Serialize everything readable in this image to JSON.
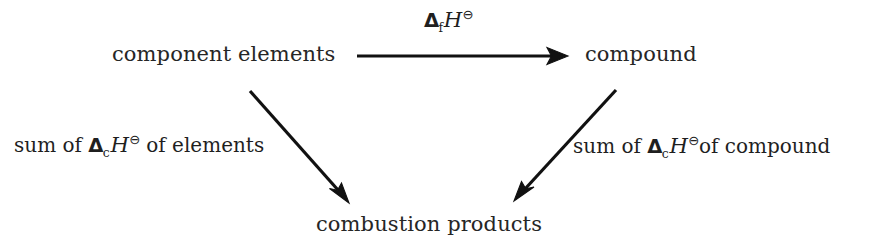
{
  "diagram": {
    "background_color": "#ffffff",
    "stroke_color": "#111111",
    "nodes": [
      {
        "id": "component-elements",
        "text": "component elements",
        "x": 112,
        "y": 42
      },
      {
        "id": "compound",
        "text": "compound",
        "x": 585,
        "y": 42
      },
      {
        "id": "combustion-products",
        "text": "combustion products",
        "x": 316,
        "y": 212
      }
    ],
    "edges": [
      {
        "id": "formation-arrow",
        "from": "component-elements",
        "to": "compound",
        "kind": "horizontal",
        "x1": 357,
        "y1": 56,
        "x2": 568,
        "y2": 56,
        "label_id": "formation-label"
      },
      {
        "id": "elements-combustion-arrow",
        "from": "component-elements",
        "to": "combustion-products",
        "kind": "diagonal-down-right",
        "x1": 250,
        "y1": 91,
        "x2": 349,
        "y2": 203,
        "label_id": "left-combustion-label"
      },
      {
        "id": "compound-combustion-arrow",
        "from": "compound",
        "to": "combustion-products",
        "kind": "diagonal-down-left",
        "x1": 616,
        "y1": 90,
        "x2": 514,
        "y2": 201,
        "label_id": "right-combustion-label"
      }
    ],
    "symbols": {
      "delta": "Δ",
      "plimsoll": "⊖",
      "enthalpy": "H",
      "subscript_formation": "f",
      "subscript_combustion": "c"
    },
    "labels": {
      "formation": {
        "prefix": "",
        "subscript": "f",
        "suffix": ""
      },
      "left_combustion": {
        "prefix": "sum of ",
        "subscript": "c",
        "suffix": " of elements"
      },
      "right_combustion": {
        "prefix": "sum of ",
        "subscript": "c",
        "suffix": "of compound"
      }
    }
  }
}
